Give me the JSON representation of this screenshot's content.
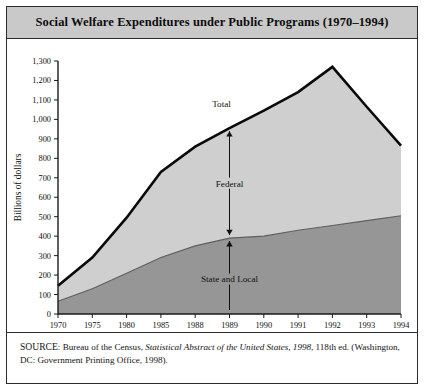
{
  "figure": {
    "title": "Social Welfare Expenditures under Public Programs (1970–1994)",
    "source_label": "SOURCE",
    "source_rest_1": ": Bureau of the Census, ",
    "source_italic": "Statistical Abstract of the United States, 1998",
    "source_rest_2": ", 118th ed. (Washington, DC: Government Printing Office, 1998)."
  },
  "annotations": {
    "total": "Total",
    "federal": "Federal",
    "state_local": "State and Local"
  },
  "chart_data": {
    "type": "area",
    "title": "Social Welfare Expenditures under Public Programs (1970–1994)",
    "xlabel": "Year",
    "ylabel": "Billions of dollars",
    "ylim": [
      0,
      1300
    ],
    "ytick_labels": [
      "0",
      "100",
      "200",
      "300",
      "400",
      "500",
      "600",
      "700",
      "800",
      "900",
      "1,000",
      "1,100",
      "1,200",
      "1,300"
    ],
    "yticks": [
      0,
      100,
      200,
      300,
      400,
      500,
      600,
      700,
      800,
      900,
      1000,
      1100,
      1200,
      1300
    ],
    "categories": [
      "1970",
      "1975",
      "1980",
      "1985",
      "1988",
      "1989",
      "1990",
      "1991",
      "1992",
      "1993",
      "1994"
    ],
    "x": [
      1970,
      1975,
      1980,
      1985,
      1988,
      1989,
      1990,
      1991,
      1992,
      1993,
      1994
    ],
    "grid": false,
    "legend": "inline-annotations",
    "series": [
      {
        "name": "Total",
        "values": [
          145,
          290,
          495,
          730,
          860,
          955,
          1045,
          1140,
          1270,
          1065,
          865
        ]
      },
      {
        "name": "State and Local",
        "values": [
          65,
          130,
          210,
          290,
          350,
          390,
          400,
          430,
          455,
          480,
          505
        ]
      },
      {
        "name": "Federal",
        "values": [
          80,
          160,
          285,
          440,
          510,
          565,
          645,
          710,
          815,
          585,
          360
        ]
      }
    ]
  }
}
